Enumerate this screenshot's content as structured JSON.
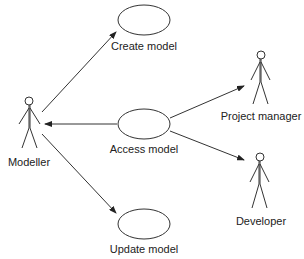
{
  "diagram": {
    "type": "uml-use-case",
    "use_cases": [
      {
        "id": "create",
        "label": "Create model"
      },
      {
        "id": "access",
        "label": "Access model"
      },
      {
        "id": "update",
        "label": "Update model"
      }
    ],
    "actors": [
      {
        "id": "modeller",
        "label": "Modeller"
      },
      {
        "id": "pm",
        "label": "Project manager"
      },
      {
        "id": "dev",
        "label": "Developer"
      }
    ],
    "associations": [
      {
        "from": "modeller",
        "to": "create",
        "arrow_at": "create"
      },
      {
        "from": "access",
        "to": "modeller",
        "arrow_at": "modeller"
      },
      {
        "from": "modeller",
        "to": "update",
        "arrow_at": "update"
      },
      {
        "from": "access",
        "to": "pm",
        "arrow_at": "pm"
      },
      {
        "from": "access",
        "to": "dev",
        "arrow_at": "dev"
      }
    ]
  }
}
